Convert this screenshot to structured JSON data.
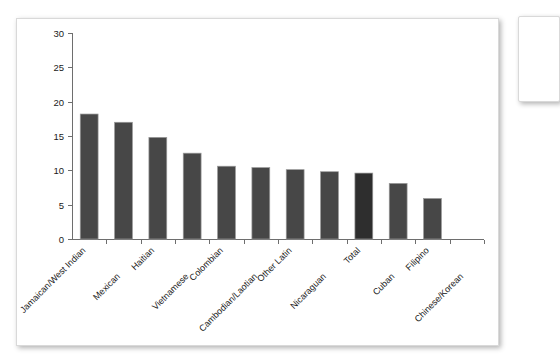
{
  "chart_data": {
    "type": "bar",
    "title": "",
    "subtitle": "",
    "xlabel": "",
    "ylabel": "",
    "ylim": [
      0,
      30
    ],
    "ytick_step": 5,
    "ytick_labels": [
      "0",
      "5",
      "10",
      "15",
      "20",
      "25",
      "30"
    ],
    "grid": false,
    "legend": false,
    "categories": [
      "Jamaican/West Indian",
      "Mexican",
      "Haitian",
      "Vietnamese",
      "Colombian",
      "Cambodian/Laotian",
      "Other Latin",
      "Nicaraguan",
      "Total",
      "Cuban",
      "Filipino",
      "Chinese/Korean"
    ],
    "values": [
      18.2,
      17.0,
      14.8,
      12.5,
      10.6,
      10.4,
      10.1,
      9.8,
      9.6,
      8.1,
      5.9,
      0
    ],
    "highlight_category": "Total",
    "bar_color": "#474747",
    "highlight_bar_color": "#2e2e2e",
    "bar_edge_color": "#9a9a9a",
    "axis_color": "#6e6e6e",
    "label_rotation_deg": -45
  },
  "canvas": {
    "background": "#ffffff",
    "card_border": "#d9d9d9"
  }
}
